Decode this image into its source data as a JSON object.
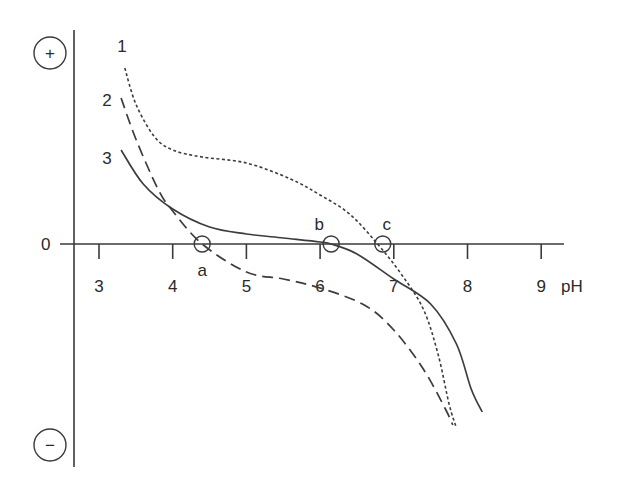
{
  "chart_data": {
    "type": "line",
    "title": "",
    "xlabel": "pH",
    "ylabel": "",
    "y_positive_symbol": "+",
    "y_negative_symbol": "−",
    "y_zero_label": "0",
    "xlim": [
      2.65,
      9.3
    ],
    "x_ticks": [
      3,
      4,
      5,
      6,
      7,
      8,
      9
    ],
    "x_tick_labels": [
      "3",
      "4",
      "5",
      "6",
      "7",
      "8",
      "9"
    ],
    "grid": false,
    "legend": "inline curve numbers",
    "y_units": "relative net charge (arbitrary; + above 0, − below)",
    "series": [
      {
        "name": "1",
        "style": "dotted",
        "x": [
          3.35,
          3.5,
          3.75,
          4.0,
          4.4,
          5.0,
          5.6,
          6.0,
          6.4,
          6.78,
          7.1,
          7.4,
          7.6,
          7.75,
          7.85
        ],
        "y": [
          3.52,
          2.8,
          2.15,
          1.88,
          1.74,
          1.62,
          1.3,
          0.98,
          0.6,
          0.0,
          -0.6,
          -1.3,
          -2.2,
          -3.2,
          -3.68
        ]
      },
      {
        "name": "2",
        "style": "dashed",
        "x": [
          3.3,
          3.5,
          3.8,
          4.0,
          4.4,
          5.0,
          5.5,
          6.0,
          6.6,
          7.0,
          7.4,
          7.7,
          7.8
        ],
        "y": [
          2.92,
          2.1,
          1.1,
          0.66,
          0.0,
          -0.56,
          -0.7,
          -0.88,
          -1.22,
          -1.72,
          -2.5,
          -3.3,
          -3.62
        ]
      },
      {
        "name": "3",
        "style": "solid",
        "x": [
          3.3,
          3.6,
          4.0,
          4.5,
          5.0,
          5.5,
          6.0,
          6.15,
          6.5,
          7.0,
          7.5,
          7.85,
          8.05,
          8.2
        ],
        "y": [
          1.88,
          1.2,
          0.7,
          0.34,
          0.2,
          0.12,
          0.04,
          0.0,
          -0.2,
          -0.7,
          -1.2,
          -2.0,
          -2.9,
          -3.36
        ]
      }
    ],
    "annotations": [
      {
        "label": "a",
        "x": 4.4,
        "y": 0,
        "marker": "open-circle",
        "note": "zero crossing of curve 2"
      },
      {
        "label": "b",
        "x": 6.15,
        "y": 0,
        "marker": "open-circle",
        "note": "zero crossing of curve 3"
      },
      {
        "label": "c",
        "x": 6.85,
        "y": 0,
        "marker": "open-circle",
        "note": "zero crossing of curve 1"
      }
    ]
  }
}
